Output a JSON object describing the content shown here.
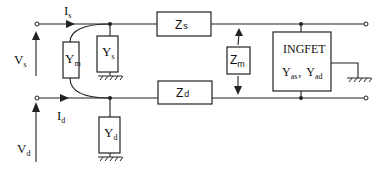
{
  "diagram": {
    "title": "",
    "ports": {
      "source": {
        "voltage": "V",
        "voltage_sub": "s",
        "current": "I",
        "current_sub": "s"
      },
      "drain": {
        "voltage": "V",
        "voltage_sub": "d",
        "current": "I",
        "current_sub": "d"
      }
    },
    "components": {
      "ym": {
        "main": "Y",
        "sub": "m"
      },
      "ys": {
        "main": "Y",
        "sub": "s"
      },
      "yd": {
        "main": "Y",
        "sub": "d"
      },
      "zs": {
        "main": "Z",
        "sub": "s"
      },
      "zd": {
        "main": "Z",
        "sub": "d"
      },
      "zm": {
        "main": "Z",
        "sub": "m"
      },
      "ingfet": {
        "title": "INGFET",
        "y1_main": "Y",
        "y1_sub": "as",
        "separator": ",",
        "y2_main": "Y",
        "y2_sub": "ad"
      }
    },
    "colors": {
      "line": "#222222",
      "background": "#ffffff"
    }
  }
}
